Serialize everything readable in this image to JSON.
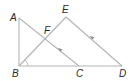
{
  "diagram": {
    "type": "geometry",
    "colors": {
      "line": "#b3b3b3",
      "label": "#2a2a2a",
      "arrow": "#8a8a8a",
      "background": "#ffffff"
    },
    "points": [
      {
        "name": "A",
        "x": 19,
        "y": 18,
        "label_x": 10,
        "label_y": 21
      },
      {
        "name": "B",
        "x": 19,
        "y": 66,
        "label_x": 12,
        "label_y": 77
      },
      {
        "name": "C",
        "x": 79,
        "y": 66,
        "label_x": 76,
        "label_y": 77
      },
      {
        "name": "D",
        "x": 122,
        "y": 66,
        "label_x": 119,
        "label_y": 77
      },
      {
        "name": "E",
        "x": 66,
        "y": 17,
        "label_x": 62,
        "label_y": 13
      },
      {
        "name": "F",
        "x": 45,
        "y": 39,
        "label_x": 44,
        "label_y": 34
      }
    ],
    "segments": [
      {
        "from": "A",
        "to": "B"
      },
      {
        "from": "A",
        "to": "C"
      },
      {
        "from": "B",
        "to": "E"
      },
      {
        "from": "E",
        "to": "D"
      },
      {
        "from": "B",
        "to": "D"
      }
    ],
    "parallel_marks": [
      {
        "segment": "AC",
        "x": 60,
        "y": 50,
        "direction": "up-left"
      },
      {
        "segment": "ED",
        "x": 92,
        "y": 38,
        "direction": "up-left"
      }
    ],
    "angle_marks": [
      {
        "vertex": "B",
        "between": [
          "E",
          "D"
        ]
      }
    ]
  }
}
